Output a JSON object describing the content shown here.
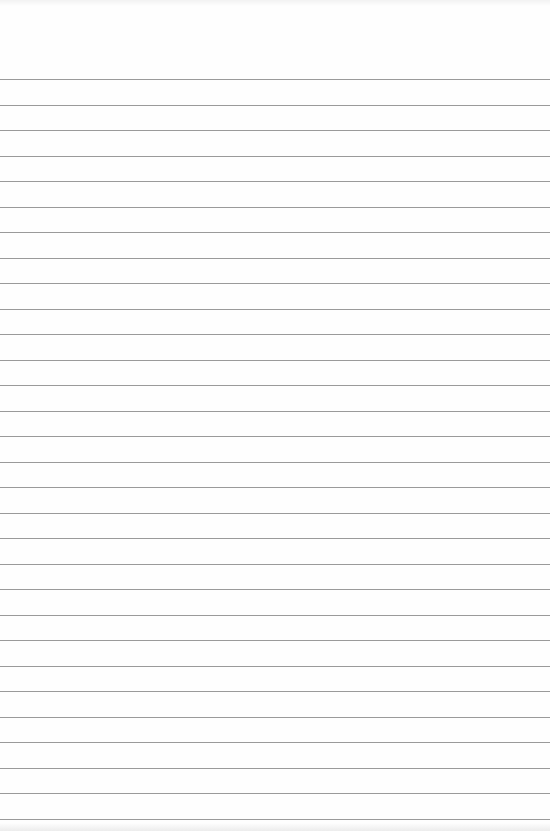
{
  "page": {
    "type": "blank lined paper",
    "background_color": "#fefefe",
    "line_color": "#9a9a9a",
    "line_count": 30,
    "first_line_y": 79,
    "line_spacing_px": 25.5
  }
}
